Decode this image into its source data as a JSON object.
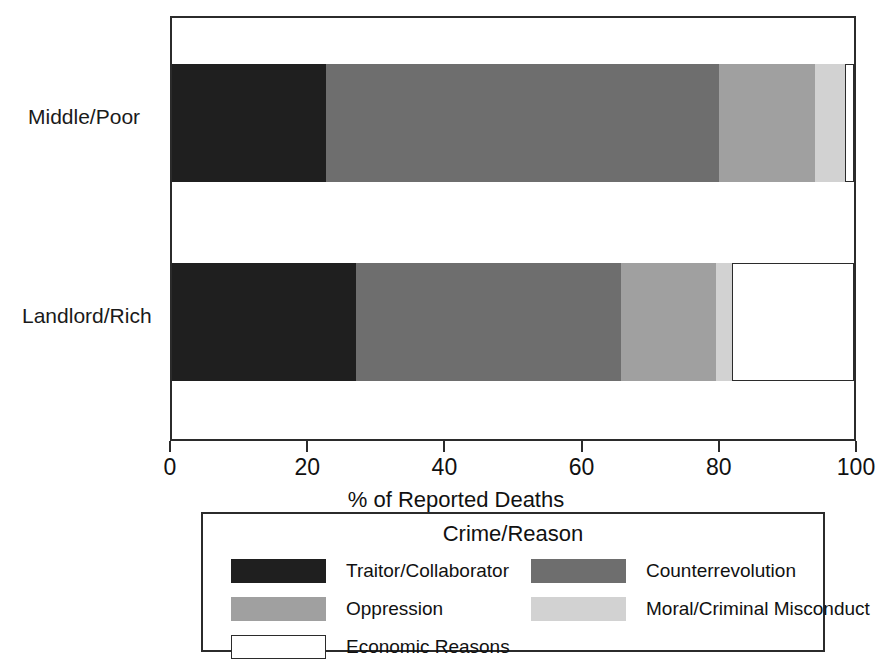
{
  "chart_data": {
    "type": "bar",
    "orientation": "horizontal",
    "stacked": true,
    "normalized": true,
    "title": "",
    "xlabel": "% of Reported Deaths",
    "ylabel": "",
    "xlim": [
      0,
      100
    ],
    "xticks": [
      0,
      20,
      40,
      60,
      80,
      100
    ],
    "xtick_labels": [
      "0",
      "20",
      "40",
      "60",
      "80",
      "100"
    ],
    "grid": false,
    "legend_title": "Crime/Reason",
    "legend_position": "below",
    "categories": [
      "Middle/Poor",
      "Landlord/Rich"
    ],
    "series": [
      {
        "name": "Traitor/Collaborator",
        "color": "#1f1f1f",
        "values": [
          22.6,
          27.0
        ]
      },
      {
        "name": "Counterrevolution",
        "color": "#6e6e6e",
        "values": [
          57.6,
          38.9
        ]
      },
      {
        "name": "Oppression",
        "color": "#a0a0a0",
        "values": [
          14.1,
          13.9
        ]
      },
      {
        "name": "Moral/Criminal Misconduct",
        "color": "#d2d2d2",
        "values": [
          4.4,
          2.3
        ]
      },
      {
        "name": "Economic Reasons",
        "color": "#ffffff",
        "values": [
          1.3,
          17.9
        ]
      }
    ]
  },
  "axis": {
    "x_title": "% of Reported Deaths",
    "ticks": [
      {
        "value": 0,
        "label": "0"
      },
      {
        "value": 20,
        "label": "20"
      },
      {
        "value": 40,
        "label": "40"
      },
      {
        "value": 60,
        "label": "60"
      },
      {
        "value": 80,
        "label": "80"
      },
      {
        "value": 100,
        "label": "100"
      }
    ],
    "y_categories": [
      {
        "label": "Middle/Poor"
      },
      {
        "label": "Landlord/Rich"
      }
    ]
  },
  "legend": {
    "title": "Crime/Reason",
    "entries": [
      {
        "label": "Traitor/Collaborator",
        "color": "#1f1f1f",
        "outlined": false
      },
      {
        "label": "Counterrevolution",
        "color": "#6e6e6e",
        "outlined": false
      },
      {
        "label": "Oppression",
        "color": "#a0a0a0",
        "outlined": false
      },
      {
        "label": "Moral/Criminal Misconduct",
        "color": "#d2d2d2",
        "outlined": false
      },
      {
        "label": "Economic Reasons",
        "color": "#ffffff",
        "outlined": true
      }
    ]
  },
  "colors": {
    "traitor": "#1f1f1f",
    "counterrevolution": "#6e6e6e",
    "oppression": "#a0a0a0",
    "moral_misconduct": "#d2d2d2",
    "economic": "#ffffff",
    "frame": "#2b2b2b",
    "text": "#111111",
    "background": "#ffffff"
  }
}
